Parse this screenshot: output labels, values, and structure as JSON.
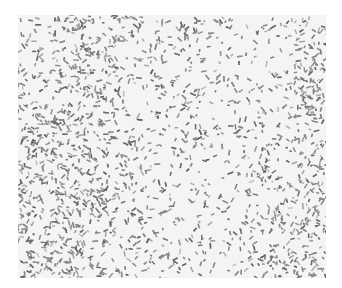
{
  "image": {
    "description": "Grayscale micrograph-like speckle texture with dense dark particle bands at the left and right edges",
    "colors": {
      "background": "#f4f4f4",
      "particle": "#8a8a8a",
      "particle_dark": "#666666"
    },
    "bands": [
      {
        "position": "left",
        "center_x": 0.12,
        "width": 0.18
      },
      {
        "position": "right",
        "center_x": 0.96,
        "width": 0.14
      }
    ]
  }
}
